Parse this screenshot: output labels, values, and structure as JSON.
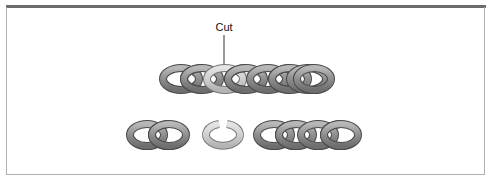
{
  "figure": {
    "annotation": {
      "label": "Cut"
    },
    "colors": {
      "top_bar": "#6b6b6b",
      "frame_border": "#b0b0b0",
      "link_fill": "#9a9a9a",
      "link_stroke": "#4a4a4a",
      "cut_link_fill": "#d2d2d2",
      "cut_link_stroke": "#777777"
    },
    "top_chain": {
      "link_count": 8,
      "cut_link_index": 2
    },
    "bottom_row": {
      "left_piece_links": 2,
      "open_link": 1,
      "right_piece_links": 4
    }
  }
}
